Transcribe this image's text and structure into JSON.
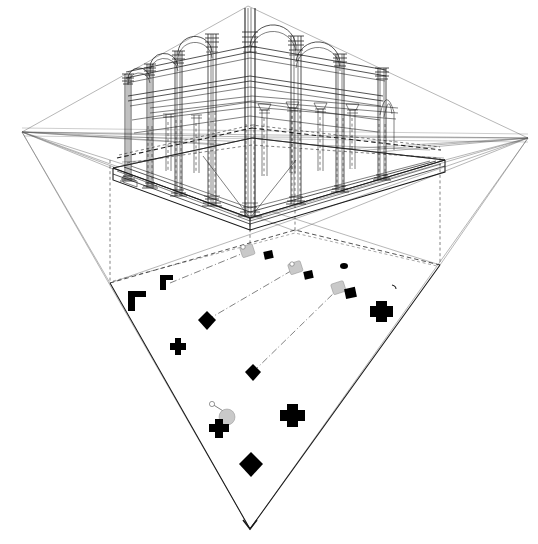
{
  "document": {
    "title": "Two-point perspective of columned hall with projected ground plan",
    "medium": "line drawing",
    "background_color": "#ffffff",
    "line_color": "#1a1a1a",
    "marker_fill": "#000000",
    "marker_shadow_fill": "#c9c9c9",
    "construction_line_color": "#6f6f6f"
  },
  "canvas": {
    "width": 538,
    "height": 544
  },
  "geometry": {
    "vanishing_point_left": {
      "x": 22,
      "y": 132,
      "label": "VPL"
    },
    "vanishing_point_right": {
      "x": 528,
      "y": 138,
      "label": "VPR"
    },
    "station_apex_top": {
      "x": 248,
      "y": 5,
      "label": "top-apex"
    },
    "station_apex_bottom": {
      "x": 250,
      "y": 529,
      "label": "bottom-apex"
    },
    "horizon_y": 135,
    "plan_quad": [
      {
        "x": 110,
        "y": 283,
        "label": "plan-left-corner"
      },
      {
        "x": 295,
        "y": 230,
        "label": "plan-top-corner"
      },
      {
        "x": 440,
        "y": 265,
        "label": "plan-right-corner"
      },
      {
        "x": 250,
        "y": 529,
        "label": "plan-bottom-apex"
      }
    ],
    "slab_quad": [
      {
        "x": 113,
        "y": 168,
        "label": "slab-left"
      },
      {
        "x": 252,
        "y": 138,
        "label": "slab-back"
      },
      {
        "x": 445,
        "y": 160,
        "label": "slab-right"
      },
      {
        "x": 250,
        "y": 218,
        "label": "slab-front"
      }
    ],
    "slab_thickness_px": 12
  },
  "perspective_view": {
    "name": "columned hall",
    "storeys": 2,
    "arch_type": "semicircular",
    "front_left_bay_count": 3,
    "front_right_bay_count": 2,
    "column_order": "composite with ringed capitals and moulded bases",
    "columns": [
      {
        "id": "c-front-corner",
        "x": 250,
        "base_y": 216,
        "top_y": 8,
        "width": 9,
        "role": "front corner pier",
        "tall": true
      },
      {
        "id": "c-left-1",
        "x": 212,
        "base_y": 206,
        "top_y": 28,
        "width": 8,
        "role": "left arcade"
      },
      {
        "id": "c-left-2",
        "x": 178,
        "base_y": 196,
        "top_y": 45,
        "width": 7,
        "role": "left arcade"
      },
      {
        "id": "c-left-3",
        "x": 150,
        "base_y": 188,
        "top_y": 58,
        "width": 6,
        "role": "left arcade"
      },
      {
        "id": "c-left-4",
        "x": 128,
        "base_y": 181,
        "top_y": 68,
        "width": 5,
        "role": "left arcade end"
      },
      {
        "id": "c-right-1",
        "x": 296,
        "base_y": 204,
        "top_y": 30,
        "width": 8,
        "role": "right arcade"
      },
      {
        "id": "c-right-2",
        "x": 340,
        "base_y": 192,
        "top_y": 50,
        "width": 7,
        "role": "right arcade"
      },
      {
        "id": "c-right-3",
        "x": 382,
        "base_y": 180,
        "top_y": 65,
        "width": 6,
        "role": "right arcade end"
      },
      {
        "id": "c-int-1",
        "x": 264,
        "base_y": 176,
        "top_y": 96,
        "width": 5,
        "role": "interior rear"
      },
      {
        "id": "c-int-2",
        "x": 292,
        "base_y": 172,
        "top_y": 98,
        "width": 5,
        "role": "interior rear"
      },
      {
        "id": "c-int-3",
        "x": 320,
        "base_y": 170,
        "top_y": 100,
        "width": 5,
        "role": "interior rear"
      },
      {
        "id": "c-int-4",
        "x": 352,
        "base_y": 168,
        "top_y": 102,
        "width": 5,
        "role": "interior rear"
      },
      {
        "id": "c-int-5",
        "x": 168,
        "base_y": 170,
        "top_y": 100,
        "width": 4,
        "role": "interior left"
      },
      {
        "id": "c-int-6",
        "x": 196,
        "base_y": 172,
        "top_y": 100,
        "width": 4,
        "role": "interior left"
      }
    ],
    "arches_left": [
      {
        "from_x": 212,
        "to_x": 178,
        "spring_y": 52,
        "id": "arch-l1"
      },
      {
        "from_x": 178,
        "to_x": 150,
        "spring_y": 66,
        "id": "arch-l2"
      },
      {
        "from_x": 150,
        "to_x": 128,
        "spring_y": 78,
        "id": "arch-l3"
      }
    ],
    "arches_right": [
      {
        "from_x": 250,
        "to_x": 296,
        "spring_y": 46,
        "id": "arch-r1"
      },
      {
        "from_x": 296,
        "to_x": 340,
        "spring_y": 62,
        "id": "arch-r2"
      }
    ],
    "entablature_lines": 4,
    "ground_beam_dashed": true
  },
  "plan_view": {
    "name": "ground plan projection",
    "outline_style": "dashed at rear, solid at front",
    "markers": [
      {
        "id": "m-corner-l",
        "x": 137,
        "y": 298,
        "type": "L-corner",
        "size": 13,
        "rot": 0
      },
      {
        "id": "m-corner-l2",
        "x": 166,
        "y": 281,
        "type": "L-corner-small",
        "size": 9,
        "rot": 0
      },
      {
        "id": "m-cross-a",
        "x": 178,
        "y": 346,
        "type": "cross",
        "size": 9
      },
      {
        "id": "m-diamond-a",
        "x": 207,
        "y": 320,
        "type": "diamond",
        "size": 9
      },
      {
        "id": "m-diamond-b",
        "x": 253,
        "y": 372,
        "type": "diamond",
        "size": 8
      },
      {
        "id": "m-diamond-c",
        "x": 251,
        "y": 464,
        "type": "diamond",
        "size": 12
      },
      {
        "id": "m-cross-b",
        "x": 219,
        "y": 428,
        "type": "cross",
        "size": 10
      },
      {
        "id": "m-cross-c",
        "x": 292,
        "y": 415,
        "type": "cross",
        "size": 13
      },
      {
        "id": "m-cross-d",
        "x": 381,
        "y": 311,
        "type": "cross",
        "size": 12
      },
      {
        "id": "m-sq-a",
        "x": 268,
        "y": 255,
        "type": "square",
        "size": 7
      },
      {
        "id": "m-sq-b",
        "x": 308,
        "y": 275,
        "type": "square",
        "size": 7
      },
      {
        "id": "m-sq-c",
        "x": 350,
        "y": 293,
        "type": "square",
        "size": 8
      },
      {
        "id": "m-dot-a",
        "x": 344,
        "y": 266,
        "type": "dot",
        "size": 5
      },
      {
        "id": "m-tick-a",
        "x": 395,
        "y": 286,
        "type": "tick",
        "size": 5
      }
    ],
    "shadow_markers": [
      {
        "id": "s-a",
        "x": 248,
        "y": 251,
        "size": 10,
        "rot": -18
      },
      {
        "id": "s-b",
        "x": 296,
        "y": 268,
        "size": 10,
        "rot": -18
      },
      {
        "id": "s-c",
        "x": 339,
        "y": 288,
        "size": 10,
        "rot": -18
      },
      {
        "id": "s-d",
        "x": 227,
        "y": 418,
        "size": 11,
        "rot": -18
      }
    ],
    "leader_lines": [
      {
        "id": "lead-1",
        "x1": 170,
        "y1": 283,
        "x2": 246,
        "y2": 252
      },
      {
        "id": "lead-2",
        "x1": 207,
        "y1": 320,
        "x2": 296,
        "y2": 268
      },
      {
        "id": "lead-3",
        "x1": 253,
        "y1": 372,
        "x2": 339,
        "y2": 288
      },
      {
        "id": "lead-4",
        "x1": 212,
        "y1": 404,
        "x2": 228,
        "y2": 414
      }
    ]
  },
  "projection_rays": {
    "from_left_vp": 9,
    "from_right_vp": 9,
    "vertical_drop_lines": 3,
    "description": "construction fan lines from both vanishing points to the plan corners"
  }
}
